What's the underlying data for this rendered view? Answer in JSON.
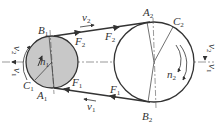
{
  "diagram": {
    "colors": {
      "line": "#333333",
      "small_pulley_fill": "#c8c8c8",
      "large_pulley_fill": "#ffffff",
      "background": "#ffffff"
    },
    "small_pulley": {
      "center": [
        52,
        62
      ],
      "radius": 26,
      "points": {
        "A": "A",
        "A_sub": "1",
        "B": "B",
        "B_sub": "1",
        "C": "C",
        "C_sub": "1"
      },
      "speed": {
        "sym": "n",
        "sub": "1"
      }
    },
    "large_pulley": {
      "center": [
        154,
        62
      ],
      "radius": 40,
      "points": {
        "A": "A",
        "A_sub": "2",
        "B": "B",
        "B_sub": "2",
        "C": "C",
        "C_sub": "2"
      },
      "speed": {
        "sym": "n",
        "sub": "2"
      }
    },
    "forces": {
      "tight_side": {
        "sym": "F",
        "sub": "1"
      },
      "slack_side": {
        "sym": "F",
        "sub": "2"
      }
    },
    "velocities": {
      "v1": {
        "sym": "v",
        "sub": "1"
      },
      "v2": {
        "sym": "v",
        "sub": "2"
      }
    }
  }
}
